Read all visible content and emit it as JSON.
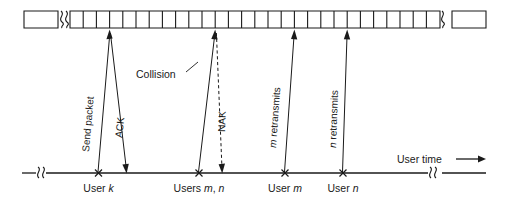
{
  "figure": {
    "colors": {
      "ink": "#1a1a1a",
      "background": "#ffffff"
    },
    "slot_row": {
      "name": "slotted-time-axis",
      "left_box_label": "",
      "right_box_label": "",
      "slot_count": 28,
      "has_left_break": true,
      "has_right_break": true
    },
    "events": [
      {
        "id": "send-packet",
        "label": "Send packet",
        "direction": "up",
        "style": "solid",
        "origin_user": "User k"
      },
      {
        "id": "ack",
        "label": "ACK",
        "direction": "down",
        "style": "solid",
        "origin_user": "User k"
      },
      {
        "id": "collision",
        "label": "Collision",
        "direction": "up",
        "style": "solid",
        "origin_user": "Users m, n"
      },
      {
        "id": "nak",
        "label": "NAK",
        "direction": "down",
        "style": "dashed",
        "origin_user": "Users m, n"
      },
      {
        "id": "m-retransmits",
        "label": "m retransmits",
        "label_italic_prefix": "m",
        "label_rest": " retransmits",
        "direction": "up",
        "style": "solid",
        "origin_user": "User m"
      },
      {
        "id": "n-retransmits",
        "label": "n retransmits",
        "label_italic_prefix": "n",
        "label_rest": " retransmits",
        "direction": "up",
        "style": "solid",
        "origin_user": "User n"
      }
    ],
    "timeline": {
      "name": "user-time-axis",
      "axis_label": "User time",
      "axis_arrow": "→",
      "has_left_break": true,
      "has_right_break": true,
      "marks": [
        {
          "id": "user-k",
          "prefix": "User ",
          "italic": "k",
          "suffix": ""
        },
        {
          "id": "users-m-n",
          "prefix": "Users ",
          "italic": "m",
          "suffix": ", ",
          "italic2": "n"
        },
        {
          "id": "user-m",
          "prefix": "User ",
          "italic": "m",
          "suffix": ""
        },
        {
          "id": "user-n",
          "prefix": "User ",
          "italic": "n",
          "suffix": ""
        }
      ]
    }
  }
}
